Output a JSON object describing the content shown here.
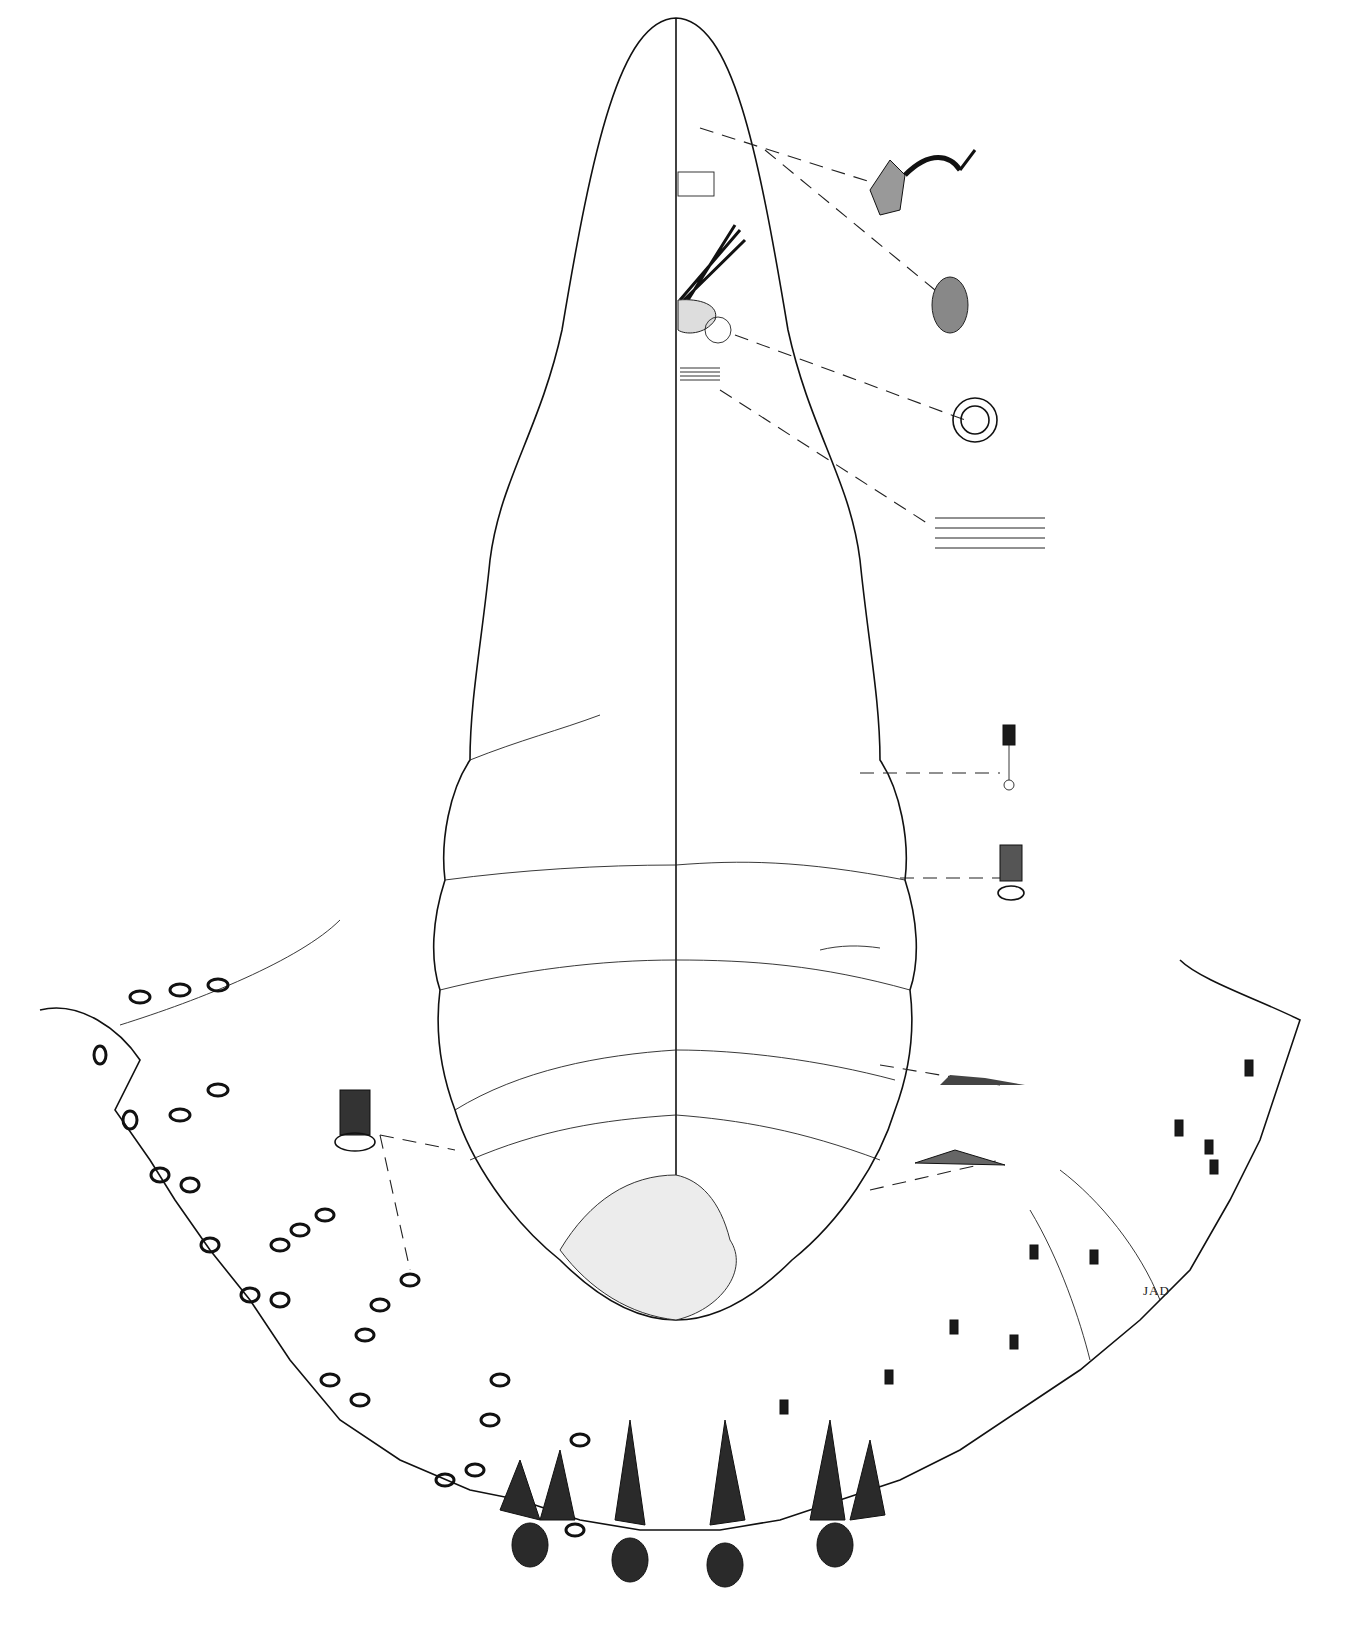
{
  "figure": {
    "signature": "JAD",
    "colors": {
      "ink": "#111111",
      "paper": "#ffffff"
    }
  }
}
